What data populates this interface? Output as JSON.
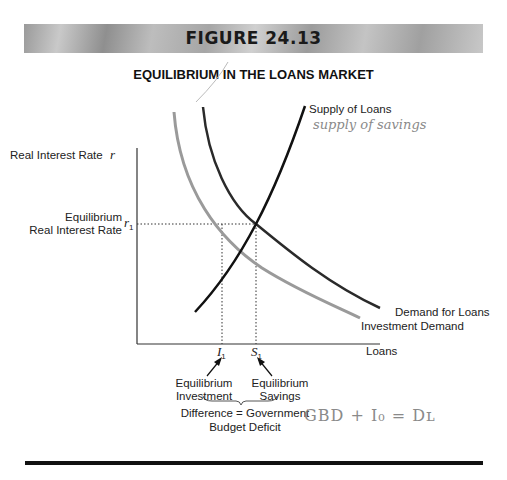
{
  "banner": {
    "title": "FIGURE 24.13"
  },
  "figure": {
    "title": "EQUILIBRIUM IN THE LOANS MARKET",
    "y_axis": {
      "label": "Real Interest Rate",
      "symbol": "r"
    },
    "x_axis": {
      "label": "Loans"
    },
    "equilibrium_rate": {
      "label_line1": "Equilibrium",
      "label_line2": "Real Interest Rate",
      "symbol": "r",
      "subscript": "1"
    },
    "curves": {
      "supply": "Supply of Loans",
      "demand": "Demand for Loans",
      "investment": "Investment Demand"
    },
    "x_markers": {
      "investment": {
        "symbol": "I",
        "subscript": "1",
        "label_line1": "Equilibrium",
        "label_line2": "Investment"
      },
      "savings": {
        "symbol": "S",
        "subscript": "1",
        "label_line1": "Equilibrium",
        "label_line2": "Savings"
      }
    },
    "difference": {
      "line1": "Difference = Government",
      "line2": "Budget Deficit"
    }
  },
  "annotations": {
    "supply_note": "supply of savings",
    "equation": "GBD + I₀ = Dʟ"
  },
  "colors": {
    "supply_curve": "#111111",
    "demand_curve": "#2a2a2a",
    "investment_curve": "#9a9a9a",
    "axis": "#333333",
    "handwriting": "#8a8a8a"
  }
}
